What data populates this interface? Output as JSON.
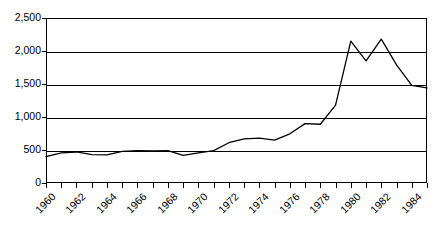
{
  "chart_data": {
    "type": "line",
    "title": "",
    "subtitle": "",
    "xlabel": "",
    "ylabel": "",
    "xlim": [
      1960,
      1985
    ],
    "ylim": [
      0,
      2500
    ],
    "grid": true,
    "legend": false,
    "legend_position": "none",
    "y_ticks": [
      0,
      500,
      1000,
      1500,
      2000,
      2500
    ],
    "y_tick_labels": [
      "0",
      "500",
      "1,000",
      "1,500",
      "2,000",
      "2,500"
    ],
    "x_ticks": [
      1960,
      1961,
      1962,
      1963,
      1964,
      1965,
      1966,
      1967,
      1968,
      1969,
      1970,
      1971,
      1972,
      1973,
      1974,
      1975,
      1976,
      1977,
      1978,
      1979,
      1980,
      1981,
      1982,
      1983,
      1984,
      1985
    ],
    "x_tick_labels": [
      "1960",
      "1962",
      "1964",
      "1966",
      "1968",
      "1970",
      "1972",
      "1974",
      "1976",
      "1978",
      "1980",
      "1982",
      "1984"
    ],
    "x_tick_label_years": [
      1960,
      1962,
      1964,
      1966,
      1968,
      1970,
      1972,
      1974,
      1976,
      1978,
      1980,
      1982,
      1984
    ],
    "x_tick_label_rotation": -45,
    "series": [
      {
        "name": "series-1",
        "color": "#000000",
        "x": [
          1960,
          1961,
          1962,
          1963,
          1964,
          1965,
          1966,
          1967,
          1968,
          1969,
          1970,
          1971,
          1972,
          1973,
          1974,
          1975,
          1976,
          1977,
          1978,
          1979,
          1980,
          1981,
          1982,
          1983,
          1984,
          1985
        ],
        "values": [
          400,
          455,
          470,
          430,
          425,
          480,
          490,
          485,
          490,
          420,
          455,
          490,
          610,
          670,
          680,
          650,
          745,
          900,
          890,
          1180,
          2150,
          1850,
          2180,
          1790,
          1480,
          1440
        ]
      }
    ]
  }
}
